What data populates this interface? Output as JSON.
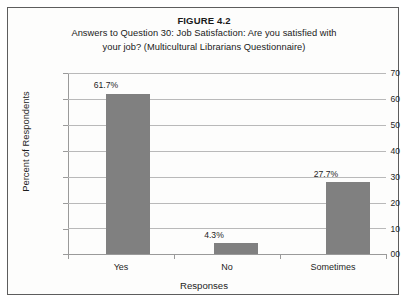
{
  "figure": {
    "title": "FIGURE 4.2",
    "subtitle_line1": "Answers to Question 30: Job Satisfaction:  Are you satisfied with",
    "subtitle_line2": "your job? (Multicultural Librarians Questionnaire)"
  },
  "colors": {
    "bar_fill": "#808080",
    "gridline": "#b9b9b9",
    "axis_line": "#9a9a9a",
    "frame_border": "#5d5d5d",
    "background": "#fdfdfc",
    "text": "#1d1d1d"
  },
  "chart_data": {
    "type": "bar",
    "title": "FIGURE 4.2",
    "subtitle": "Answers to Question 30: Job Satisfaction:  Are you satisfied with your job? (Multicultural Librarians Questionnaire)",
    "xlabel": "Responses",
    "ylabel": "Percent of Respondents",
    "categories": [
      "Yes",
      "No",
      "Sometimes"
    ],
    "values": [
      61.7,
      4.3,
      27.7
    ],
    "data_labels": [
      "61.7%",
      "4.3%",
      "27.7%"
    ],
    "ylim": [
      0,
      70
    ],
    "ytick_values": [
      0,
      10,
      20,
      30,
      40,
      50,
      60,
      70
    ],
    "ytick_labels": [
      "00",
      "10",
      "20",
      "30",
      "40",
      "50",
      "60",
      "70"
    ],
    "grid": true,
    "grid_axis": "y",
    "legend": false,
    "legend_position": "none",
    "series": [
      {
        "name": "Percent of Respondents",
        "values": [
          61.7,
          4.3,
          27.7
        ]
      }
    ]
  }
}
